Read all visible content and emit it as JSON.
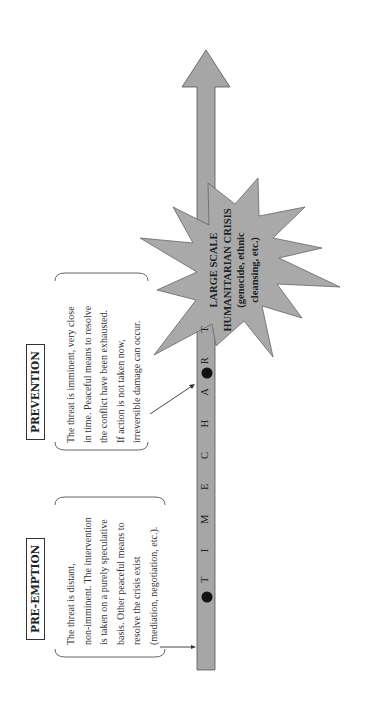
{
  "timeline": {
    "label": "TIME CHART",
    "label_spaced": "T I M E   C H A R T",
    "fill_color": "#a6a6a6",
    "marker_color": "#111111"
  },
  "stages": [
    {
      "title": "PRE-EMPTION",
      "lines": [
        "The threat is distant,",
        "non-imminent. The intervention",
        "is taken on a purely speculative",
        "basis. Other peaceful means to",
        "resolve the crisis exist",
        "(mediation, negotiation, etc.)."
      ]
    },
    {
      "title": "PREVENTION",
      "lines": [
        "The threat is imminent, very close",
        "in time. Peaceful means to resolve",
        "the conflict have been exhausted.",
        "If action is not taken now,",
        "irreversible damage can occur."
      ]
    }
  ],
  "crisis": {
    "lines": [
      "LARGE SCALE",
      "HUMANITARIAN CRISIS",
      "(genocide, ethnic",
      "cleansing, etc.)"
    ],
    "fill_color": "#a9a9a9"
  }
}
